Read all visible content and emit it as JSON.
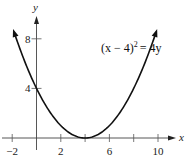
{
  "chart_data": {
    "type": "line",
    "title": "",
    "equation": "(x − 4)² = 4y",
    "equation_parts": {
      "lhs": "(x − 4)",
      "exp": "2",
      "rhs": "= 4y"
    },
    "xlabel": "x",
    "ylabel": "y",
    "xlim": [
      -2.5,
      11.5
    ],
    "ylim": [
      -0.5,
      9.5
    ],
    "x_ticks": [
      -2,
      0,
      2,
      4,
      6,
      8,
      10
    ],
    "x_tick_labels": [
      "−2",
      "2",
      "6",
      "10"
    ],
    "x_tick_label_values": [
      -2,
      2,
      6,
      10
    ],
    "y_ticks": [
      4,
      8
    ],
    "y_tick_labels": [
      "4",
      "8"
    ],
    "grid": false,
    "legend": null,
    "series": [
      {
        "name": "(x − 4)² = 4y",
        "function": "y = (x-4)^2/4",
        "x": [
          -2,
          -1,
          0,
          1,
          2,
          3,
          4,
          5,
          6,
          7,
          8,
          9,
          10
        ],
        "values": [
          9,
          6.25,
          4,
          2.25,
          1,
          0.25,
          0,
          0.25,
          1,
          2.25,
          4,
          6.25,
          9
        ],
        "vertex": [
          4,
          0
        ],
        "arrows_at_ends": true
      }
    ]
  }
}
